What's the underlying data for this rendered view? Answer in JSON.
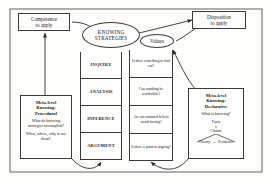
{
  "figure": {
    "title_competence": "Competence\nto apply",
    "title_disposition": "Disposition\nto apply"
  },
  "nodes": {
    "competence": {
      "line1": "Competence",
      "line2": "to apply"
    },
    "disposition": {
      "line1": "Disposition",
      "line2": "to apply"
    },
    "knowing_strategies": {
      "line1": "KNOWING",
      "line2": "STRATEGIES"
    },
    "values": {
      "label": "Values"
    }
  },
  "strategies": [
    {
      "label": "INQUIRY"
    },
    {
      "label": "ANALYSIS"
    },
    {
      "label": "INFERENCE"
    },
    {
      "label": "ARGUMENT"
    }
  ],
  "values_column": [
    {
      "text": "Is there something to find out?"
    },
    {
      "text": "Can anything be worthwhile?"
    },
    {
      "text": "Are unexamined beliefs worth having?"
    },
    {
      "text": "Is there a point to arguing?"
    }
  ],
  "meta_procedural": {
    "heading_line1": "Meta-level",
    "heading_line2": "Knowing:",
    "heading_line3": "Procedural",
    "q1": "What do knowing strategies accomplish?",
    "q2": "When, where, why to use them?"
  },
  "meta_declarative": {
    "heading_line1": "Meta-level",
    "heading_line2": "Knowing:",
    "heading_line3": "Declarative",
    "q1": "What is knowing?",
    "facts": "Facts",
    "vs": "v",
    "claims": "Claims",
    "theory": "Theory",
    "dash": "—",
    "evidence": "Evidence"
  },
  "colors": {
    "stroke": "#3a3a3a",
    "background": "#fdfdfc",
    "text": "#1a1a1a"
  }
}
